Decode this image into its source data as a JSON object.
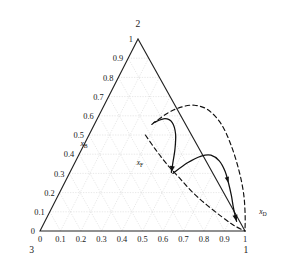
{
  "chart_data": {
    "type": "line",
    "title": "",
    "plot_kind": "ternary-residue-curve-map",
    "geometry": {
      "apex_top": [
        138,
        39
      ],
      "vertex_bottom_left": [
        40,
        231
      ],
      "vertex_bottom_right": [
        245,
        231
      ],
      "grid_interval": 0.1,
      "grid": true,
      "axis_range": [
        0,
        1
      ]
    },
    "components": {
      "top_label": "2",
      "bottom_left_label": "3",
      "bottom_right_label": "1"
    },
    "axes": {
      "bottom": {
        "name": "x1",
        "ticks": [
          "0",
          "0.1",
          "0.2",
          "0.3",
          "0.4",
          "0.5",
          "0.6",
          "0.7",
          "0.8",
          "0.9",
          "1"
        ],
        "values": [
          0,
          0.1,
          0.2,
          0.3,
          0.4,
          0.5,
          0.6,
          0.7,
          0.8,
          0.9,
          1
        ]
      },
      "left": {
        "name": "x2",
        "ticks": [
          "0",
          "0.1",
          "0.2",
          "0.3",
          "0.4",
          "0.5",
          "0.6",
          "0.7",
          "0.8",
          "0.9",
          "1"
        ],
        "values": [
          0,
          0.1,
          0.2,
          0.3,
          0.4,
          0.5,
          0.6,
          0.7,
          0.8,
          0.9,
          1
        ]
      }
    },
    "annotations": [
      {
        "id": "xB",
        "label": "xB",
        "sub": "B",
        "x": 0.28,
        "y": 0.54,
        "px": [
          84,
          146
        ]
      },
      {
        "id": "xF",
        "label": "xF",
        "sub": "F",
        "x": 0.5,
        "y": 0.3,
        "px": [
          140,
          165
        ]
      },
      {
        "id": "xD",
        "label": "xD",
        "sub": "D",
        "x": 0.94,
        "y": 0.06,
        "px": [
          263,
          214
        ]
      }
    ],
    "series": [
      {
        "name": "upper-dashed-boundary",
        "style": "dashed",
        "points": [
          [
            0.28,
            0.555
          ],
          [
            0.33,
            0.615
          ],
          [
            0.38,
            0.645
          ],
          [
            0.44,
            0.655
          ],
          [
            0.52,
            0.63
          ],
          [
            0.62,
            0.555
          ],
          [
            0.72,
            0.445
          ],
          [
            0.82,
            0.315
          ],
          [
            0.9,
            0.195
          ],
          [
            0.96,
            0.085
          ],
          [
            1.0,
            0.0
          ]
        ]
      },
      {
        "name": "lower-dashed-boundary",
        "style": "dashed",
        "points": [
          [
            0.275,
            0.5
          ],
          [
            0.36,
            0.425
          ],
          [
            0.45,
            0.35
          ],
          [
            0.55,
            0.275
          ],
          [
            0.65,
            0.2
          ],
          [
            0.75,
            0.135
          ],
          [
            0.85,
            0.075
          ],
          [
            0.93,
            0.03
          ],
          [
            1.0,
            0.0
          ]
        ]
      },
      {
        "name": "residue-curve-B-to-F",
        "style": "solid",
        "arrow_at_end": true,
        "points": [
          [
            0.285,
            0.565
          ],
          [
            0.33,
            0.585
          ],
          [
            0.375,
            0.565
          ],
          [
            0.42,
            0.505
          ],
          [
            0.455,
            0.425
          ],
          [
            0.48,
            0.35
          ],
          [
            0.495,
            0.305
          ]
        ]
      },
      {
        "name": "residue-curve-F-to-D",
        "style": "solid",
        "arrow_at_end": true,
        "points": [
          [
            0.505,
            0.3
          ],
          [
            0.55,
            0.355
          ],
          [
            0.6,
            0.39
          ],
          [
            0.645,
            0.395
          ],
          [
            0.7,
            0.365
          ],
          [
            0.755,
            0.31
          ],
          [
            0.8,
            0.25
          ],
          [
            0.845,
            0.185
          ],
          [
            0.88,
            0.13
          ],
          [
            0.91,
            0.085
          ],
          [
            0.935,
            0.05
          ]
        ]
      }
    ]
  },
  "figure": {
    "background": "#ffffff",
    "axis_color": "#222222",
    "grid_color": "#d9d9d9",
    "curve_color": "#111111"
  }
}
